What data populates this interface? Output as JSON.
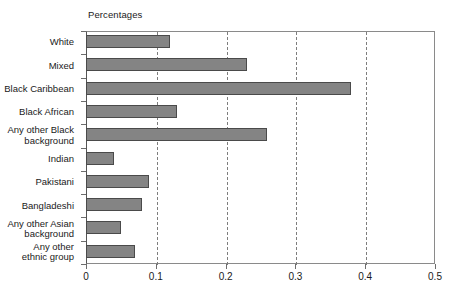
{
  "chart_data": {
    "type": "bar",
    "orientation": "horizontal",
    "title": "Percentages",
    "xlabel": "",
    "ylabel": "",
    "xlim": [
      0,
      0.5
    ],
    "xticks": [
      "0",
      "0.1",
      "0.2",
      "0.3",
      "0.4",
      "0.5"
    ],
    "xtick_values": [
      0,
      0.1,
      0.2,
      0.3,
      0.4,
      0.5
    ],
    "grid": "vertical-dashed",
    "legend": "none",
    "categories": [
      "White",
      "Mixed",
      "Black Caribbean",
      "Black African",
      "Any other Black\nbackground",
      "Indian",
      "Pakistani",
      "Bangladeshi",
      "Any other Asian\nbackground",
      "Any other\nethnic group"
    ],
    "values": [
      0.12,
      0.23,
      0.38,
      0.13,
      0.26,
      0.04,
      0.09,
      0.08,
      0.05,
      0.07
    ],
    "bar_color": "#848484",
    "bar_edge_color": "#4a4a4a",
    "axis_color": "#8a8a8a",
    "gridline_color": "#7d7d7d"
  }
}
